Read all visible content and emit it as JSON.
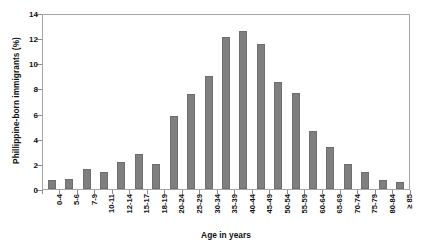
{
  "chart_data": {
    "type": "bar",
    "title": "",
    "xlabel": "Age in years",
    "ylabel": "Phillippine-born immigrants (%)",
    "categories": [
      "0-4",
      "5-6",
      "7-9",
      "10-11",
      "12-14",
      "15-17",
      "18-19",
      "20-24",
      "25-29",
      "30-34",
      "35-39",
      "40-44",
      "45-49",
      "50-54",
      "55-59",
      "60-64",
      "65-69",
      "70-74",
      "75-79",
      "80-84",
      "≥ 85"
    ],
    "values": [
      0.7,
      0.8,
      1.6,
      1.4,
      2.2,
      2.8,
      2.05,
      5.9,
      7.65,
      9.1,
      12.2,
      12.7,
      11.7,
      8.6,
      7.7,
      4.7,
      3.4,
      2.0,
      1.4,
      0.75,
      0.6
    ],
    "ylim": [
      0,
      14
    ],
    "yticks": [
      0,
      2,
      4,
      6,
      8,
      10,
      12,
      14
    ],
    "grid": false,
    "legend": null,
    "bar_color": "#7f7f7f",
    "bar_edge_color": "#6e6e6e",
    "axis_color": "#a6a6a6"
  }
}
